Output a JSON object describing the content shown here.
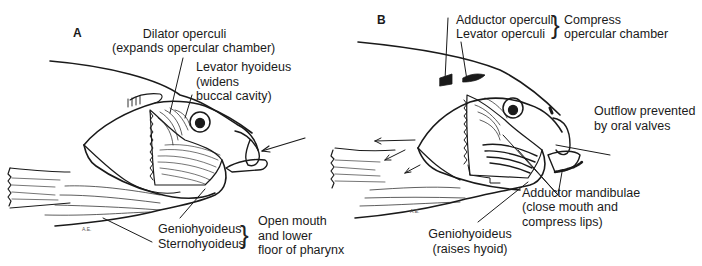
{
  "panel_a": {
    "letter": "A",
    "labels": {
      "dilator_title": "Dilator operculi",
      "dilator_desc": "(expands opercular chamber)",
      "levator_hyoideus_1": "Levator hyoideus",
      "levator_hyoideus_2": "(widens",
      "levator_hyoideus_3": "buccal cavity)",
      "geniohyoideus": "Geniohyoideus",
      "sternohyoideus": "Sternohyoideus",
      "group_desc_1": "Open mouth",
      "group_desc_2": "and lower",
      "group_desc_3": "floor of pharynx"
    },
    "signature": "A.E."
  },
  "panel_b": {
    "letter": "B",
    "labels": {
      "adductor_operculi": "Adductor operculi",
      "levator_operculi": "Levator operculi",
      "group_desc_1": "Compress",
      "group_desc_2": "opercular chamber",
      "outflow_1": "Outflow prevented",
      "outflow_2": "by oral valves",
      "adductor_mandibulae_1": "Adductor mandibulae",
      "adductor_mandibulae_2": "(close mouth and",
      "adductor_mandibulae_3": "compress lips)",
      "geniohyoideus_1": "Geniohyoideus",
      "geniohyoideus_2": "(raises hyoid)"
    },
    "signature": "A.E."
  },
  "colors": {
    "ink": "#1a1a1a",
    "background": "#ffffff"
  }
}
